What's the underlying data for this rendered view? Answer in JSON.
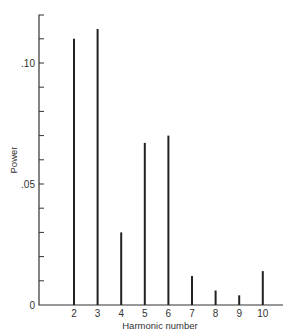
{
  "chart_data": {
    "type": "bar",
    "title": "",
    "xlabel": "Harmonic number",
    "ylabel": "Power",
    "categories": [
      "2",
      "3",
      "4",
      "5",
      "6",
      "7",
      "8",
      "9",
      "10"
    ],
    "values": [
      0.11,
      0.114,
      0.03,
      0.067,
      0.07,
      0.012,
      0.006,
      0.004,
      0.014
    ],
    "ylim": [
      0,
      0.12
    ],
    "yticks": [
      0,
      0.05,
      0.1
    ],
    "ytick_labels": [
      "0",
      ".05",
      ".10"
    ],
    "yminor_step": 0.01,
    "grid": false,
    "legend": null,
    "bar_style": "thin vertical lines"
  }
}
